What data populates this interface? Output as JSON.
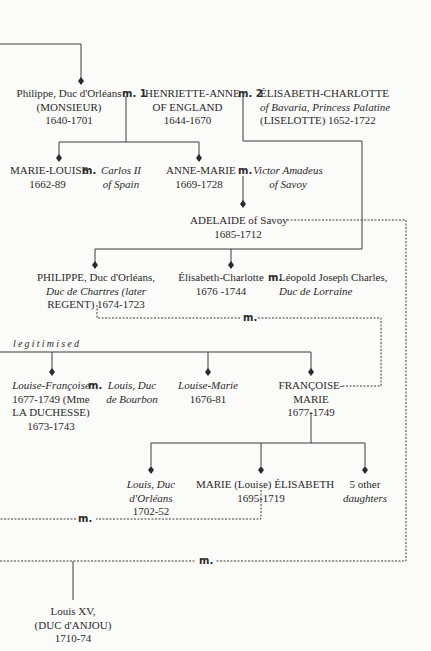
{
  "diagram": {
    "type": "family-tree",
    "people": {
      "philippe_monsieur": {
        "line1": "Philippe, Duc d'Orléans",
        "line2": "(MONSIEUR)",
        "line3": "1640-1701"
      },
      "henriette_anne": {
        "line1": "HENRIETTE-ANNE",
        "line2": "OF ENGLAND",
        "line3": "1644-1670"
      },
      "elisabeth_charlotte_bavaria": {
        "line1": "ÉLISABETH-CHARLOTTE",
        "line2": "of Bavaria, Princess Palatine",
        "line3": "(LISELOTTE) 1652-1722"
      },
      "marie_louise": {
        "line1": "MARIE-LOUISE",
        "line2": "1662-89"
      },
      "carlos_ii": {
        "line1": "Carlos II",
        "line2": "of Spain"
      },
      "anne_marie": {
        "line1": "ANNE-MARIE",
        "line2": "1669-1728"
      },
      "victor_amadeus": {
        "line1": "Victor Amadeus",
        "line2": "of Savoy"
      },
      "adelaide": {
        "line1": "ADELAIDE of Savoy",
        "line2": "1685-1712"
      },
      "philippe_regent": {
        "line1": "PHILIPPE, Duc d'Orléans,",
        "line2": "Duc de Chartres (later",
        "line3": "REGENT) 1674-1723"
      },
      "elisabeth_charlotte_lorraine": {
        "line1": "Élisabeth-Charlotte",
        "line2": "1676 -1744"
      },
      "leopold": {
        "line1": "Léopold Joseph Charles,",
        "line2": "Duc de Lorraine"
      },
      "louise_francoise": {
        "line1": "Louise-Françoise",
        "line2": "1677-1749 (Mme",
        "line3": "LA DUCHESSE)",
        "line4": "1673-1743"
      },
      "louis_bourbon": {
        "line1": "Louis, Duc",
        "line2": "de Bourbon"
      },
      "louise_marie": {
        "line1": "Louise-Marie",
        "line2": "1676-81"
      },
      "francoise_marie": {
        "line1": "FRANÇOISE-",
        "line2": "MARIE",
        "line3": "1677-1749"
      },
      "louis_orleans": {
        "line1": "Louis, Duc",
        "line2": "d'Orléans",
        "line3": "1702-52"
      },
      "marie_louise_elisabeth": {
        "line1": "MARIE (Louise) ÉLISABETH",
        "line2": "1695-1719"
      },
      "other_daughters": {
        "line1": "5 other",
        "line2": "daughters"
      },
      "louis_xv": {
        "line1": "Louis XV,",
        "line2": "(DUC d'ANJOU)",
        "line3": "1710-74"
      }
    },
    "marriage_labels": {
      "m": "m.",
      "m1": "m. 1",
      "m2": "m. 2"
    },
    "legitimised_label": "legitimised",
    "colors": {
      "line": "#3a3a3a",
      "background": "#fbfbf9",
      "text": "#2a2a2a"
    }
  }
}
